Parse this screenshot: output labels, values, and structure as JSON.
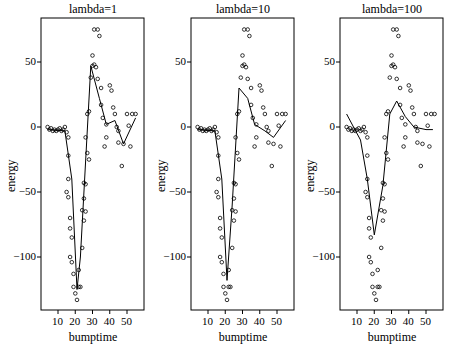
{
  "figure": {
    "panels": [
      {
        "title": "lambda=1",
        "xlabel": "bumptime",
        "ylabel": "energy"
      },
      {
        "title": "lambda=10",
        "xlabel": "bumptime",
        "ylabel": "energy"
      },
      {
        "title": "lambda=100",
        "xlabel": "bumptime",
        "ylabel": "energy"
      }
    ],
    "xticks": [
      "10",
      "20",
      "30",
      "40",
      "50"
    ],
    "yticks": [
      "50",
      "0",
      "-50",
      "-100"
    ]
  },
  "chart_data": [
    {
      "type": "scatter",
      "title": "lambda=1",
      "xlabel": "bumptime",
      "ylabel": "energy",
      "xlim": [
        0,
        58
      ],
      "ylim": [
        -140,
        80
      ],
      "xticks": [
        10,
        20,
        30,
        40,
        50
      ],
      "yticks": [
        -100,
        -50,
        0,
        50
      ],
      "grid": false,
      "points": [
        [
          4,
          0
        ],
        [
          5,
          -2
        ],
        [
          6,
          -1
        ],
        [
          7,
          -3
        ],
        [
          8,
          -2
        ],
        [
          9,
          -3
        ],
        [
          10,
          -2
        ],
        [
          11,
          -1
        ],
        [
          12,
          -3
        ],
        [
          13,
          -2
        ],
        [
          14,
          0
        ],
        [
          15,
          -4
        ],
        [
          16,
          -8
        ],
        [
          16,
          -22
        ],
        [
          16,
          -40
        ],
        [
          15,
          -50
        ],
        [
          16,
          -54
        ],
        [
          17,
          -70
        ],
        [
          17,
          -78
        ],
        [
          18,
          -85
        ],
        [
          17,
          -100
        ],
        [
          18,
          -104
        ],
        [
          19,
          -113
        ],
        [
          19,
          -123
        ],
        [
          20,
          -128
        ],
        [
          21,
          -133
        ],
        [
          22,
          -123
        ],
        [
          23,
          -123
        ],
        [
          22,
          -110
        ],
        [
          24,
          -93
        ],
        [
          25,
          -72
        ],
        [
          24,
          -64
        ],
        [
          26,
          -65
        ],
        [
          25,
          -55
        ],
        [
          25,
          -43
        ],
        [
          26,
          -44
        ],
        [
          28,
          -25
        ],
        [
          27,
          -20
        ],
        [
          26,
          -8
        ],
        [
          27,
          10
        ],
        [
          28,
          12
        ],
        [
          29,
          38
        ],
        [
          30,
          47
        ],
        [
          31,
          48
        ],
        [
          30,
          55
        ],
        [
          32,
          46
        ],
        [
          33,
          37
        ],
        [
          31,
          75
        ],
        [
          33,
          75
        ],
        [
          34,
          70
        ],
        [
          35,
          30
        ],
        [
          35,
          17
        ],
        [
          36,
          7
        ],
        [
          37,
          -15
        ],
        [
          38,
          -8
        ],
        [
          38,
          2
        ],
        [
          40,
          32
        ],
        [
          41,
          28
        ],
        [
          42,
          15
        ],
        [
          43,
          10
        ],
        [
          44,
          0
        ],
        [
          45,
          -12
        ],
        [
          45,
          -3
        ],
        [
          47,
          -30
        ],
        [
          48,
          -13
        ],
        [
          50,
          10
        ],
        [
          51,
          1
        ],
        [
          52,
          -15
        ],
        [
          53,
          10
        ],
        [
          55,
          10
        ]
      ],
      "fit_line": [
        [
          4,
          -2
        ],
        [
          14,
          -3
        ],
        [
          18,
          -40
        ],
        [
          21,
          -125
        ],
        [
          23,
          -100
        ],
        [
          29,
          47
        ],
        [
          34,
          22
        ],
        [
          38,
          2
        ],
        [
          43,
          5
        ],
        [
          48,
          -13
        ],
        [
          55,
          7
        ]
      ]
    },
    {
      "type": "scatter",
      "title": "lambda=10",
      "xlabel": "bumptime",
      "ylabel": "energy",
      "xlim": [
        0,
        58
      ],
      "ylim": [
        -140,
        80
      ],
      "xticks": [
        10,
        20,
        30,
        40,
        50
      ],
      "yticks": [
        -100,
        -50,
        0,
        50
      ],
      "grid": false,
      "points": "same as lambda=1",
      "fit_line": [
        [
          4,
          -2
        ],
        [
          14,
          -3
        ],
        [
          18,
          -40
        ],
        [
          21,
          -118
        ],
        [
          24,
          -60
        ],
        [
          28,
          30
        ],
        [
          33,
          22
        ],
        [
          37,
          2
        ],
        [
          43,
          -3
        ],
        [
          48,
          -8
        ],
        [
          55,
          5
        ]
      ]
    },
    {
      "type": "scatter",
      "title": "lambda=100",
      "xlabel": "bumptime",
      "ylabel": "energy",
      "xlim": [
        0,
        58
      ],
      "ylim": [
        -140,
        80
      ],
      "xticks": [
        10,
        20,
        30,
        40,
        50
      ],
      "yticks": [
        -100,
        -50,
        0,
        50
      ],
      "grid": false,
      "points": "same as lambda=1",
      "fit_line": [
        [
          4,
          10
        ],
        [
          8,
          0
        ],
        [
          12,
          -10
        ],
        [
          16,
          -40
        ],
        [
          20,
          -83
        ],
        [
          25,
          -45
        ],
        [
          29,
          10
        ],
        [
          33,
          20
        ],
        [
          38,
          8
        ],
        [
          43,
          0
        ],
        [
          50,
          -2
        ],
        [
          54,
          -2
        ]
      ]
    }
  ]
}
